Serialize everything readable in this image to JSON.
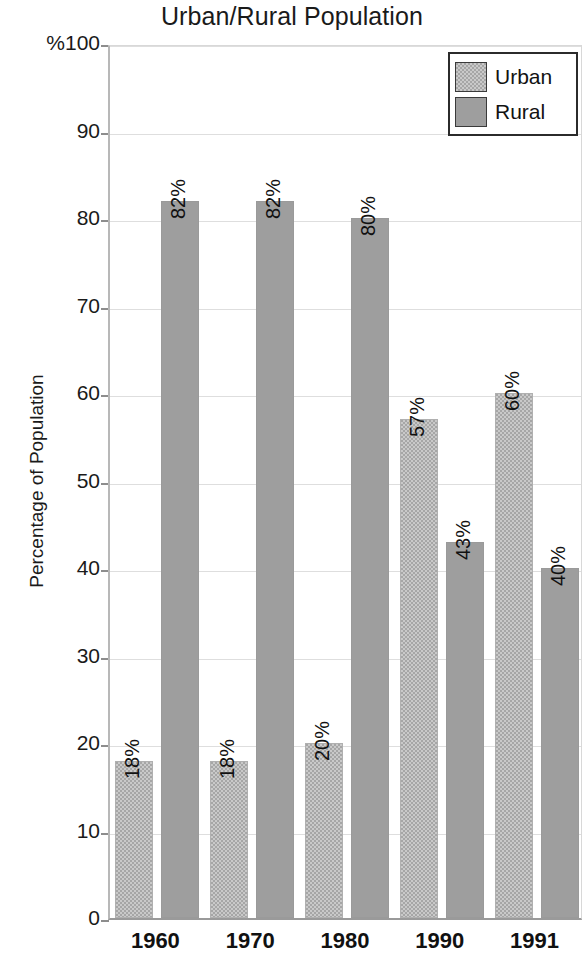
{
  "chart_data": {
    "type": "bar",
    "title": "Urban/Rural Population",
    "xlabel": "",
    "ylabel": "Percentage of Population",
    "categories": [
      "1960",
      "1970",
      "1980",
      "1990",
      "1991"
    ],
    "series": [
      {
        "name": "Urban",
        "values": [
          18,
          18,
          20,
          57,
          60
        ],
        "labels": [
          "18%",
          "18%",
          "20%",
          "57%",
          "60%"
        ],
        "color": "#b5b5b5",
        "pattern": "checkered"
      },
      {
        "name": "Rural",
        "values": [
          82,
          82,
          80,
          43,
          40
        ],
        "labels": [
          "82%",
          "82%",
          "80%",
          "43%",
          "40%"
        ],
        "color": "#9e9e9e",
        "pattern": "solid"
      }
    ],
    "ylim": [
      0,
      100
    ],
    "yticks": [
      0,
      10,
      20,
      30,
      40,
      50,
      60,
      70,
      80,
      90,
      100
    ],
    "ytick_labels": [
      "0",
      "10",
      "20",
      "30",
      "40",
      "50",
      "60",
      "70",
      "80",
      "90",
      "%100"
    ],
    "grid": true,
    "legend_position": "top-right",
    "value_label_rotation": "vertical"
  },
  "legend": {
    "entries": [
      {
        "label": "Urban"
      },
      {
        "label": "Rural"
      }
    ]
  },
  "axes": {
    "y_axis_title": "Percentage of Population",
    "unit_prefix": "%"
  }
}
